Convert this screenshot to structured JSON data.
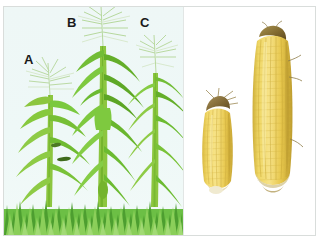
{
  "figure": {
    "panel_count": 2
  },
  "left_panel": {
    "name": "maize-field-panel",
    "background_color": "#eef7f6",
    "ground_label": "grass",
    "plants": [
      {
        "id": "A",
        "label": "A",
        "description": "shortest maize plant",
        "relative_height_pct": 70,
        "leaf_color": "#7ac943",
        "stem_color": "#8cc63f"
      },
      {
        "id": "B",
        "label": "B",
        "description": "tallest maize plant with prominent tassel",
        "relative_height_pct": 100,
        "leaf_color": "#6fbe3d",
        "stem_color": "#8cc63f"
      },
      {
        "id": "C",
        "label": "C",
        "description": "intermediate maize plant",
        "relative_height_pct": 85,
        "leaf_color": "#82cc4c",
        "stem_color": "#8cc63f"
      }
    ]
  },
  "right_panel": {
    "name": "maize-cob-panel",
    "background_color": "#ffffff",
    "cobs": [
      {
        "id": "small-cob",
        "label": "small ear of maize",
        "relative_length_pct": 62,
        "kernel_color": "#f2d45c",
        "husk_color": "#8a7340"
      },
      {
        "id": "large-cob",
        "label": "large ear of maize",
        "relative_length_pct": 100,
        "kernel_color": "#f0d24f",
        "husk_color": "#9a8442"
      }
    ]
  },
  "colors": {
    "frame": "#d9dddb",
    "divider": "#e2e6e5",
    "sky": "#eef7f6",
    "grass_dark": "#3f9b2f",
    "grass_light": "#8ed15c",
    "label_text": "#1a1a1a"
  }
}
